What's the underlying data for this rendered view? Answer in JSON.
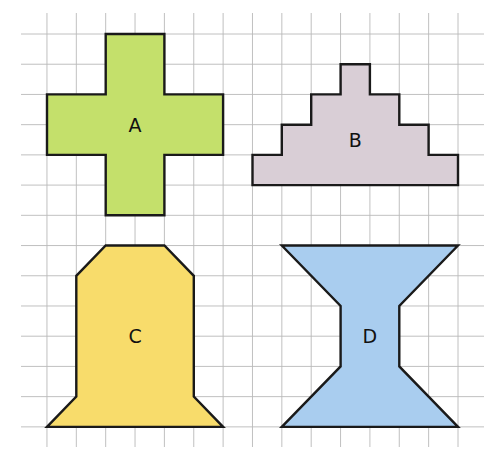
{
  "grid": {
    "x0": 17.6,
    "dx": 29.36,
    "y0": 34,
    "dy": 30.22,
    "cols": [
      0,
      16
    ],
    "rows": [
      -0.7,
      13.7
    ],
    "line_x_extent": [
      21,
      484
    ],
    "line_y_extent": [
      13,
      447
    ],
    "line_color": "#b9b9b9"
  },
  "shapes": [
    {
      "id": "A",
      "label": "A",
      "fill": "#c4e06b",
      "points": [
        [
          3,
          0
        ],
        [
          5,
          0
        ],
        [
          5,
          2
        ],
        [
          7,
          2
        ],
        [
          7,
          4
        ],
        [
          5,
          4
        ],
        [
          5,
          6
        ],
        [
          3,
          6
        ],
        [
          3,
          4
        ],
        [
          1,
          4
        ],
        [
          1,
          2
        ],
        [
          3,
          2
        ]
      ],
      "label_at": [
        4,
        3
      ]
    },
    {
      "id": "B",
      "label": "B",
      "fill": "#d9ced6",
      "points": [
        [
          11,
          1
        ],
        [
          12,
          1
        ],
        [
          12,
          2
        ],
        [
          13,
          2
        ],
        [
          13,
          3
        ],
        [
          14,
          3
        ],
        [
          14,
          4
        ],
        [
          15,
          4
        ],
        [
          15,
          5
        ],
        [
          8,
          5
        ],
        [
          8,
          4
        ],
        [
          9,
          4
        ],
        [
          9,
          3
        ],
        [
          10,
          3
        ],
        [
          10,
          2
        ],
        [
          11,
          2
        ]
      ],
      "label_at": [
        11.5,
        3.5
      ]
    },
    {
      "id": "C",
      "label": "C",
      "fill": "#f8dc6b",
      "points": [
        [
          3,
          7
        ],
        [
          5,
          7
        ],
        [
          6,
          8
        ],
        [
          6,
          12
        ],
        [
          7,
          13
        ],
        [
          1,
          13
        ],
        [
          2,
          12
        ],
        [
          2,
          8
        ]
      ],
      "label_at": [
        4,
        10
      ]
    },
    {
      "id": "D",
      "label": "D",
      "fill": "#a9cdef",
      "points": [
        [
          9,
          7
        ],
        [
          15,
          7
        ],
        [
          13,
          9
        ],
        [
          13,
          11
        ],
        [
          15,
          13
        ],
        [
          9,
          13
        ],
        [
          11,
          11
        ],
        [
          11,
          9
        ]
      ],
      "label_at": [
        12,
        10
      ]
    }
  ]
}
